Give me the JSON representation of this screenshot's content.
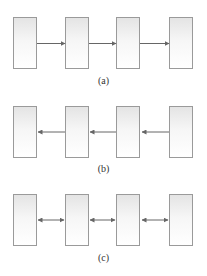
{
  "diagram": {
    "panels": [
      {
        "id": "a",
        "caption": "(a)",
        "arrow_direction": "right",
        "boxes": 4
      },
      {
        "id": "b",
        "caption": "(b)",
        "arrow_direction": "left",
        "boxes": 4
      },
      {
        "id": "c",
        "caption": "(c)",
        "arrow_direction": "both",
        "boxes": 4
      }
    ],
    "colors": {
      "box_border": "#9a9a9a",
      "arrow": "#666666"
    }
  }
}
